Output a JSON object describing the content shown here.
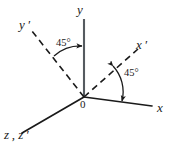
{
  "figure": {
    "stroke_color": "#1a1a1a",
    "background_color": "#ffffff",
    "width": 172,
    "height": 150
  },
  "labels": {
    "y_axis": "y",
    "y_prime_axis": "y ′",
    "x_prime_axis": "x ′",
    "x_axis": "x",
    "z_axes": "z , z ′",
    "origin": "0",
    "angle_left": "45°",
    "angle_right": "45°"
  },
  "geometry": {
    "origin": {
      "x": 84,
      "y": 97
    },
    "axes": [
      {
        "name": "y-axis",
        "style": "solid",
        "from": [
          84,
          97
        ],
        "to": [
          84,
          19
        ]
      },
      {
        "name": "x-axis",
        "style": "solid",
        "from": [
          84,
          97
        ],
        "to": [
          152,
          106
        ]
      },
      {
        "name": "z-axis",
        "style": "solid",
        "from": [
          84,
          97
        ],
        "to": [
          22,
          133
        ]
      },
      {
        "name": "y-prime-axis",
        "style": "dashed",
        "from": [
          84,
          97
        ],
        "to": [
          32,
          31
        ]
      },
      {
        "name": "x-prime-axis",
        "style": "dashed",
        "from": [
          84,
          97
        ],
        "to": [
          138,
          49
        ]
      }
    ],
    "angle_arcs": [
      {
        "name": "angle-arc-left",
        "between": [
          "y-prime-axis",
          "y-axis"
        ],
        "value_deg": 45
      },
      {
        "name": "angle-arc-right",
        "between": [
          "x-prime-axis",
          "x-axis"
        ],
        "value_deg": 45
      }
    ]
  }
}
